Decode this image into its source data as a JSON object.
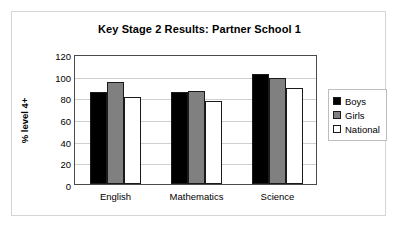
{
  "chart_data": {
    "type": "bar",
    "title": "Key Stage 2 Results: Partner School 1",
    "xlabel": "",
    "ylabel": "% level 4+",
    "categories": [
      "English",
      "Mathematics",
      "Science"
    ],
    "series": [
      {
        "name": "Boys",
        "values": [
          85,
          85,
          102
        ],
        "color": "#000000"
      },
      {
        "name": "Girls",
        "values": [
          94,
          86,
          98
        ],
        "color": "#808080"
      },
      {
        "name": "National",
        "values": [
          80,
          77,
          89
        ],
        "color": "#ffffff"
      }
    ],
    "ylim": [
      0,
      120
    ],
    "yticks": [
      0,
      20,
      40,
      60,
      80,
      100,
      120
    ],
    "ytick_labels": [
      "0",
      "20",
      "40",
      "60",
      "80",
      "100",
      "120"
    ],
    "grid": true,
    "legend_position": "right",
    "legend_entries": [
      "Boys",
      "Girls",
      "National"
    ]
  },
  "colors": {
    "boys": "#000000",
    "girls": "#808080",
    "national": "#ffffff",
    "frame": "#d5d5d5",
    "axis": "#4a4a4a",
    "gridline": "#cfcfcf"
  }
}
